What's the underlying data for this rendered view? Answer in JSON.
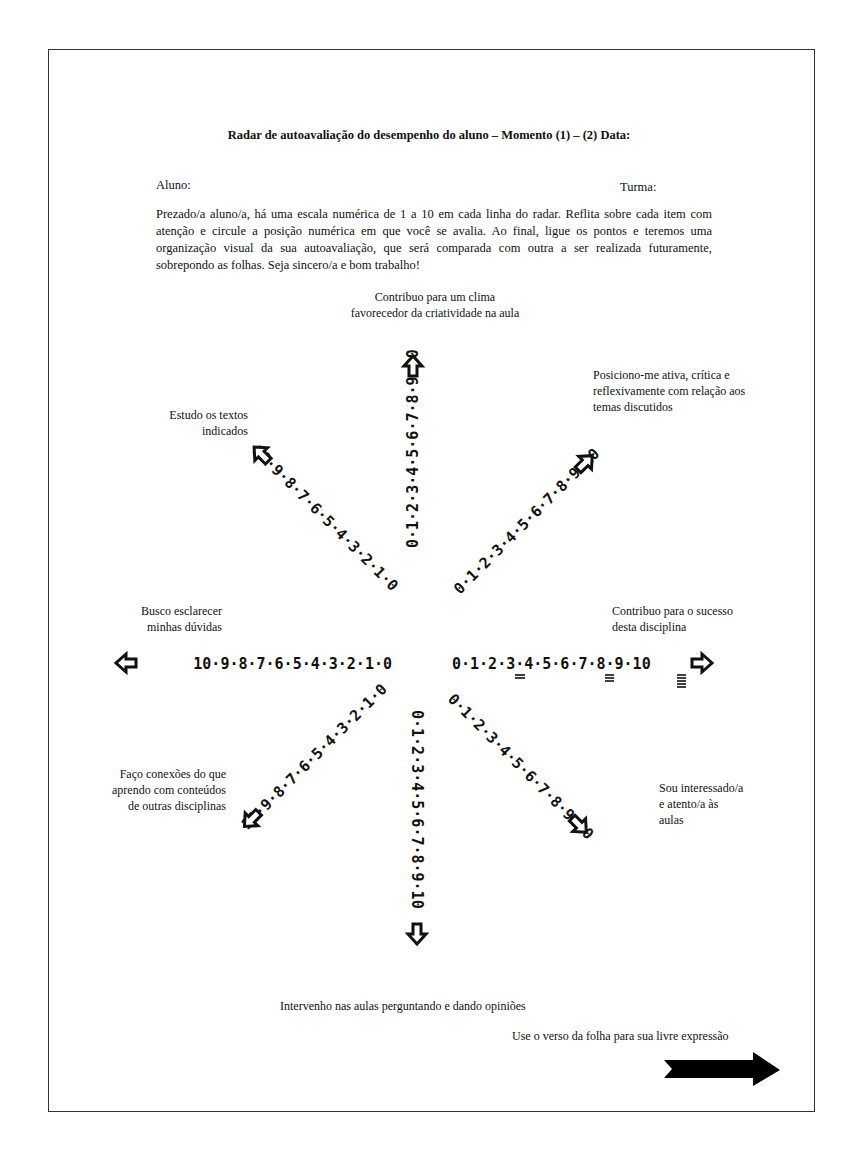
{
  "document": {
    "title": "Radar de autoavaliação do desempenho do aluno – Momento (1) – (2) Data:",
    "student_label": "Aluno:",
    "class_label": "Turma:",
    "instructions": "Prezado/a aluno/a, há uma escala numérica de 1 a 10 em cada linha do radar. Reflita sobre cada item com atenção e circule a posição numérica em que você se avalia. Ao final, ligue os pontos e teremos uma organização visual da sua autoavaliação, que será comparada com outra a ser realizada futuramente, sobrepondo as folhas. Seja sincero/a e bom trabalho!",
    "footer_note": "Use o verso da folha para sua livre expressão"
  },
  "radar": {
    "scale_min": 0,
    "scale_max": 10,
    "axes": [
      {
        "direction": "up",
        "label_line1": "Contribuo para um clima",
        "label_line2": "favorecedor da criatividade na aula"
      },
      {
        "direction": "up-right",
        "label_line1": "Posiciono-me ativa, crítica e",
        "label_line2": "reflexivamente com relação aos",
        "label_line3": "temas discutidos"
      },
      {
        "direction": "right",
        "label_line1": "Contribuo para o sucesso",
        "label_line2": "desta disciplina"
      },
      {
        "direction": "down-right",
        "label_line1": "Sou interessado/a",
        "label_line2": "e atento/a às",
        "label_line3": "aulas"
      },
      {
        "direction": "down",
        "label_line1": "Intervenho nas aulas perguntando e dando opiniões"
      },
      {
        "direction": "down-left",
        "label_line1": "Faço conexões do que",
        "label_line2": "aprendo com conteúdos",
        "label_line3": "de outras disciplinas"
      },
      {
        "direction": "left",
        "label_line1": "Busco esclarecer",
        "label_line2": "minhas dúvidas"
      },
      {
        "direction": "up-left",
        "label_line1": "Estudo os textos",
        "label_line2": "indicados"
      }
    ],
    "scale_string": "0·1·2·3·4·5·6·7·8·9·10",
    "scale_string_reversed": "10·9·8·7·6·5·4·3·2·1·0"
  }
}
